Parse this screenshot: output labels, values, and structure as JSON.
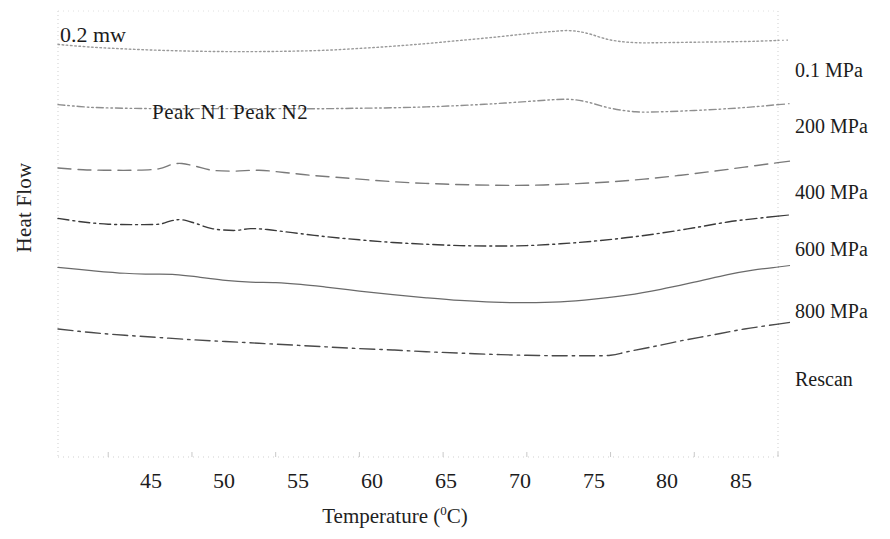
{
  "figure": {
    "y_axis_title": "Heat Flow",
    "x_axis_title_main": "Temperature (",
    "x_axis_title_sup": "0",
    "x_axis_title_tail": "C)",
    "annotation_power": "0.2 mw",
    "annotation_peaks": "Peak N1 Peak N2"
  },
  "labels": {
    "t45": "45",
    "t50": "50",
    "t55": "55",
    "t60": "60",
    "t65": "65",
    "t70": "70",
    "t75": "75",
    "t80": "80",
    "t85": "85",
    "s0": "0.1 MPa",
    "s1": "200 MPa",
    "s2": "400 MPa",
    "s3": "600 MPa",
    "s4": "800 MPa",
    "s5": "Rescan"
  },
  "chart_data": {
    "type": "line",
    "title": "",
    "subtitle": "",
    "xlabel": "Temperature (°C)",
    "ylabel": "Heat Flow",
    "xlim": [
      42,
      85
    ],
    "ylim": [
      0,
      1
    ],
    "grid": false,
    "legend_position": "right-of-curve-ends",
    "xticks": [
      45,
      50,
      55,
      60,
      65,
      70,
      75,
      80,
      85
    ],
    "xticklabels": [
      "45",
      "50",
      "55",
      "60",
      "65",
      "70",
      "75",
      "80",
      "85"
    ],
    "yticks": [],
    "yticklabels": [],
    "annotations": [
      {
        "text": "0.2 mw",
        "x": 43.2,
        "note": "vertical scale bar magnitude"
      },
      {
        "text": "Peak N1 Peak N2",
        "x": 51.5,
        "note": "denaturation peak identifiers"
      }
    ],
    "axis_colors": {
      "frame": "#c9c9c9",
      "text": "#1c1c1c"
    },
    "series": [
      {
        "name": "0.1 MPa",
        "linestyle": "dotted",
        "color": "#9a9a9a",
        "x": [
          42.0,
          44.0,
          46.0,
          48.0,
          50.0,
          52.0,
          54.0,
          56.0,
          58.0,
          60.0,
          62.0,
          64.0,
          66.0,
          68.0,
          70.0,
          71.5,
          72.5,
          73.5,
          75.0,
          76.5,
          78.0,
          80.0,
          82.0,
          83.5,
          85.0
        ],
        "y": [
          0.925,
          0.919,
          0.915,
          0.912,
          0.91,
          0.909,
          0.909,
          0.91,
          0.912,
          0.916,
          0.921,
          0.927,
          0.934,
          0.941,
          0.949,
          0.954,
          0.956,
          0.951,
          0.935,
          0.929,
          0.929,
          0.93,
          0.931,
          0.932,
          0.934
        ]
      },
      {
        "name": "200 MPa",
        "linestyle": "dashdotdot",
        "color": "#8f8f8f",
        "x": [
          42.0,
          44.0,
          46.0,
          48.0,
          50.0,
          52.0,
          54.0,
          56.0,
          58.0,
          60.0,
          62.0,
          64.0,
          66.0,
          68.0,
          70.0,
          71.5,
          72.5,
          73.5,
          75.0,
          76.5,
          78.0,
          80.0,
          82.0,
          83.5,
          85.0
        ],
        "y": [
          0.79,
          0.784,
          0.782,
          0.781,
          0.781,
          0.781,
          0.781,
          0.781,
          0.781,
          0.782,
          0.783,
          0.785,
          0.788,
          0.792,
          0.797,
          0.801,
          0.802,
          0.797,
          0.782,
          0.774,
          0.774,
          0.777,
          0.781,
          0.785,
          0.79
        ]
      },
      {
        "name": "400 MPa",
        "linestyle": "longdash",
        "color": "#7a7a7a",
        "x": [
          42.0,
          43.5,
          45.0,
          46.5,
          48.0,
          48.8,
          49.4,
          50.2,
          51.2,
          52.5,
          54.0,
          55.5,
          57.0,
          59.0,
          61.0,
          63.0,
          65.0,
          67.0,
          69.0,
          71.0,
          73.0,
          75.0,
          77.0,
          79.0,
          81.0,
          83.0,
          85.0
        ],
        "y": [
          0.648,
          0.644,
          0.643,
          0.643,
          0.646,
          0.656,
          0.658,
          0.652,
          0.643,
          0.641,
          0.643,
          0.638,
          0.632,
          0.626,
          0.62,
          0.615,
          0.612,
          0.61,
          0.609,
          0.61,
          0.613,
          0.617,
          0.623,
          0.631,
          0.64,
          0.65,
          0.66
        ]
      },
      {
        "name": "600 MPa",
        "linestyle": "dashdot",
        "color": "#3a3a3a",
        "x": [
          42.0,
          43.5,
          45.0,
          46.5,
          48.0,
          48.8,
          49.4,
          50.2,
          51.2,
          52.5,
          53.5,
          54.5,
          56.0,
          58.0,
          60.0,
          62.0,
          64.0,
          66.0,
          68.0,
          70.0,
          72.0,
          74.0,
          76.0,
          78.0,
          80.0,
          82.0,
          83.5,
          85.0
        ],
        "y": [
          0.535,
          0.527,
          0.522,
          0.521,
          0.522,
          0.53,
          0.532,
          0.524,
          0.512,
          0.508,
          0.512,
          0.51,
          0.503,
          0.494,
          0.487,
          0.481,
          0.477,
          0.474,
          0.473,
          0.474,
          0.478,
          0.484,
          0.492,
          0.502,
          0.514,
          0.527,
          0.534,
          0.54
        ]
      },
      {
        "name": "800 MPa",
        "linestyle": "solid",
        "color": "#6a6a6a",
        "x": [
          42.0,
          44.0,
          46.0,
          47.5,
          49.0,
          50.5,
          52.0,
          53.5,
          55.0,
          56.5,
          58.0,
          60.0,
          62.0,
          64.0,
          66.0,
          68.0,
          70.0,
          72.0,
          74.0,
          76.0,
          78.0,
          80.0,
          82.0,
          83.5,
          85.0
        ],
        "y": [
          0.425,
          0.418,
          0.412,
          0.41,
          0.409,
          0.403,
          0.396,
          0.392,
          0.391,
          0.387,
          0.381,
          0.372,
          0.364,
          0.357,
          0.351,
          0.347,
          0.346,
          0.348,
          0.354,
          0.363,
          0.376,
          0.392,
          0.409,
          0.419,
          0.426
        ]
      },
      {
        "name": "Rescan",
        "linestyle": "dashdot-long",
        "color": "#4a4a4a",
        "x": [
          42.0,
          44.0,
          46.0,
          48.0,
          50.0,
          52.0,
          54.0,
          56.0,
          58.0,
          60.0,
          62.0,
          64.0,
          66.0,
          68.0,
          70.0,
          72.0,
          73.5,
          75.0,
          76.0,
          77.5,
          79.0,
          81.0,
          83.0,
          85.0
        ],
        "y": [
          0.287,
          0.279,
          0.273,
          0.268,
          0.263,
          0.259,
          0.255,
          0.251,
          0.247,
          0.243,
          0.24,
          0.236,
          0.233,
          0.23,
          0.228,
          0.227,
          0.227,
          0.228,
          0.236,
          0.247,
          0.259,
          0.273,
          0.287,
          0.298
        ]
      }
    ]
  }
}
